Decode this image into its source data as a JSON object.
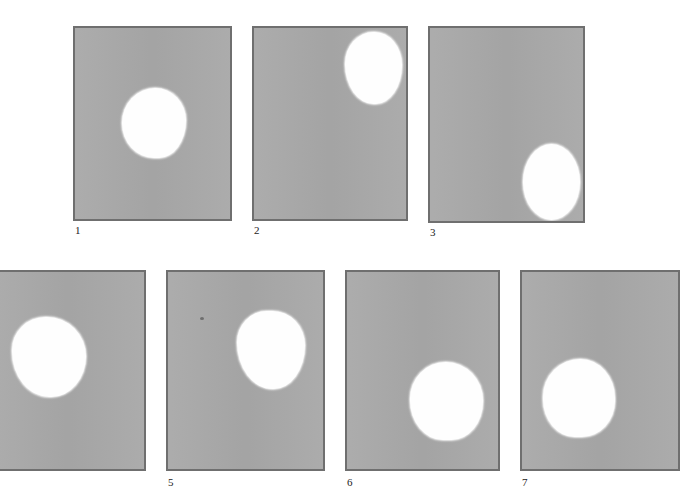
{
  "figure": {
    "background_color": "#ffffff",
    "frame_fill_color": "#a9a9a9",
    "frame_border_color": "#6f6f6f",
    "blob_color": "#fefefe",
    "panels": [
      {
        "label": "1",
        "frame": {
          "x": 73,
          "y": 26,
          "w": 159,
          "h": 195
        },
        "blob": {
          "cx": 155,
          "cy": 120,
          "w": 64,
          "h": 70
        },
        "label_pos": {
          "x": 75,
          "y": 224
        }
      },
      {
        "label": "2",
        "frame": {
          "x": 252,
          "y": 26,
          "w": 156,
          "h": 195
        },
        "blob": {
          "cx": 372,
          "cy": 66,
          "w": 57,
          "h": 72
        },
        "label_pos": {
          "x": 254,
          "y": 224
        }
      },
      {
        "label": "3",
        "frame": {
          "x": 428,
          "y": 26,
          "w": 157,
          "h": 197
        },
        "blob": {
          "cx": 550,
          "cy": 180,
          "w": 57,
          "h": 76
        },
        "label_pos": {
          "x": 430,
          "y": 226
        }
      },
      {
        "label": "",
        "frame": {
          "x": -10,
          "y": 270,
          "w": 156,
          "h": 201
        },
        "blob": {
          "cx": 48,
          "cy": 355,
          "w": 74,
          "h": 80
        },
        "label_pos": {
          "x": 0,
          "y": 476
        }
      },
      {
        "label": "5",
        "frame": {
          "x": 166,
          "y": 270,
          "w": 159,
          "h": 201
        },
        "blob": {
          "cx": 271,
          "cy": 348,
          "w": 68,
          "h": 78
        },
        "label_pos": {
          "x": 168,
          "y": 476
        }
      },
      {
        "label": "6",
        "frame": {
          "x": 345,
          "y": 270,
          "w": 155,
          "h": 201
        },
        "blob": {
          "cx": 446,
          "cy": 401,
          "w": 73,
          "h": 78
        },
        "label_pos": {
          "x": 347,
          "y": 476
        }
      },
      {
        "label": "7",
        "frame": {
          "x": 520,
          "y": 270,
          "w": 160,
          "h": 201
        },
        "blob": {
          "cx": 579,
          "cy": 398,
          "w": 72,
          "h": 78
        },
        "label_pos": {
          "x": 522,
          "y": 476
        }
      }
    ]
  }
}
